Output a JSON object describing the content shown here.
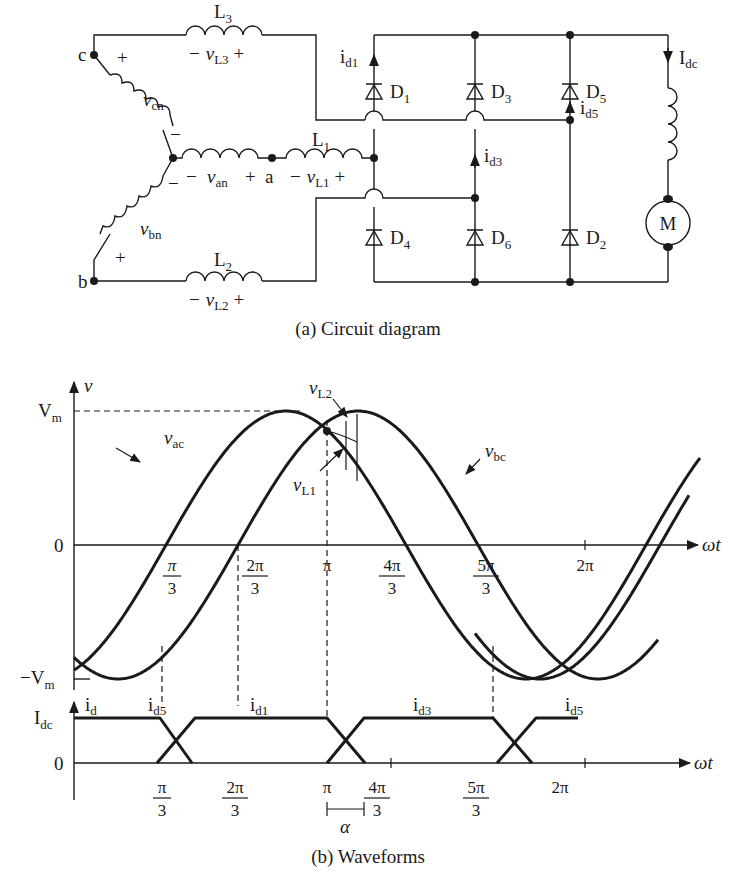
{
  "figure": {
    "caption_a": "(a) Circuit diagram",
    "caption_b": "(b) Waveforms"
  },
  "circuit": {
    "nodes": {
      "c": "c",
      "b": "b",
      "a": "a"
    },
    "sources": [
      {
        "name": "v",
        "sub": "cn",
        "plus": "+",
        "minus": "−"
      },
      {
        "name": "v",
        "sub": "an",
        "plus": "+",
        "minus": "−"
      },
      {
        "name": "v",
        "sub": "bn",
        "plus": "+",
        "minus": "−"
      }
    ],
    "inductors": [
      {
        "label": "L",
        "label_sub": "1",
        "volt": "v",
        "volt_sub": "L1",
        "minus": "−",
        "plus": "+"
      },
      {
        "label": "L",
        "label_sub": "2",
        "volt": "v",
        "volt_sub": "L2",
        "minus": "−",
        "plus": "+"
      },
      {
        "label": "L",
        "label_sub": "3",
        "volt": "v",
        "volt_sub": "L3",
        "minus": "−",
        "plus": "+"
      }
    ],
    "diodes": [
      {
        "label": "D",
        "sub": "1"
      },
      {
        "label": "D",
        "sub": "3"
      },
      {
        "label": "D",
        "sub": "5"
      },
      {
        "label": "D",
        "sub": "4"
      },
      {
        "label": "D",
        "sub": "6"
      },
      {
        "label": "D",
        "sub": "2"
      }
    ],
    "currents": [
      {
        "label": "i",
        "sub": "d1"
      },
      {
        "label": "i",
        "sub": "d3"
      },
      {
        "label": "i",
        "sub": "d5"
      },
      {
        "label": "I",
        "sub": "dc"
      }
    ],
    "motor": "M"
  },
  "chart_data": [
    {
      "type": "line",
      "title": "Line voltages during commutation",
      "ylabel": "v",
      "xlabel": "ωt",
      "y_ticks": [
        {
          "label": "V",
          "sub": "m",
          "value": 1
        },
        {
          "label": "0",
          "sub": "",
          "value": 0
        },
        {
          "label": "−V",
          "sub": "m",
          "value": -1
        }
      ],
      "x_ticks": [
        {
          "num": "π",
          "den": "3",
          "value": 1.0472
        },
        {
          "num": "2π",
          "den": "3",
          "value": 2.0944
        },
        {
          "num": "π",
          "den": "",
          "value": 3.1416
        },
        {
          "num": "4π",
          "den": "3",
          "value": 4.1888
        },
        {
          "num": "5π",
          "den": "3",
          "value": 5.236
        },
        {
          "num": "2π",
          "den": "",
          "value": 6.2832
        }
      ],
      "series": [
        {
          "name": "v_ac",
          "label": "v",
          "sub": "ac",
          "amplitude": 1,
          "zero_up_crossing_px": 166
        },
        {
          "name": "v_bc",
          "label": "v",
          "sub": "bc",
          "amplitude": 1,
          "zero_up_crossing_px": 238
        },
        {
          "name": "v_ba",
          "label": "",
          "sub": "",
          "amplitude": 1,
          "zero_up_crossing_px": 660
        }
      ],
      "annotations": [
        {
          "label": "v",
          "sub": "L2"
        },
        {
          "label": "v",
          "sub": "L1"
        }
      ],
      "grid": false
    },
    {
      "type": "line",
      "title": "Diode currents",
      "ylabel": "i",
      "ylabel_sub": "d",
      "xlabel": "ωt",
      "y_ticks": [
        {
          "label": "I",
          "sub": "dc",
          "value": 1
        },
        {
          "label": "0",
          "sub": "",
          "value": 0
        }
      ],
      "series": [
        {
          "name": "i_d5",
          "label": "i",
          "sub": "d5",
          "segments": "high from 0 to π/3, falls to 0 over overlap α"
        },
        {
          "name": "i_d1",
          "label": "i",
          "sub": "d1",
          "segments": "rises at π/3, high until π, falls over α"
        },
        {
          "name": "i_d3",
          "label": "i",
          "sub": "d3",
          "segments": "rises at π, high until 5π/3, falls over α"
        },
        {
          "name": "i_d5_next",
          "label": "i",
          "sub": "d5",
          "segments": "rises at 5π/3"
        }
      ],
      "overlap_label": "α"
    }
  ]
}
